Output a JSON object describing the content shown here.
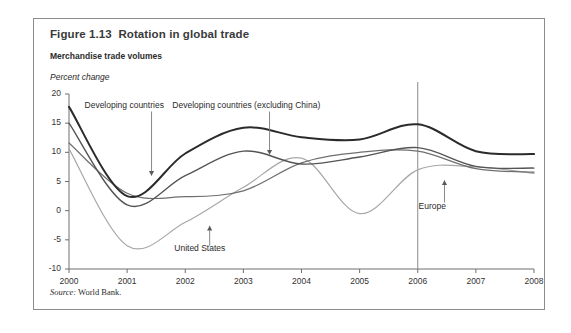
{
  "figure": {
    "title": "Figure 1.13  Rotation in global trade",
    "subtitle": "Merchandise trade volumes",
    "axis_unit": "Percent change",
    "source_prefix": "Source:",
    "source_text": " World Bank."
  },
  "chart_data": {
    "type": "line",
    "title": "Rotation in global trade",
    "subtitle": "Merchandise trade volumes",
    "xlabel": "",
    "ylabel": "Percent change",
    "x": [
      2000,
      2001,
      2002,
      2003,
      2004,
      2005,
      2006,
      2007,
      2008
    ],
    "xlim": [
      2000,
      2008
    ],
    "ylim": [
      -10,
      20
    ],
    "yticks": [
      -10,
      -5,
      0,
      5,
      10,
      15,
      20
    ],
    "ytick_labels": [
      "-10",
      "-5",
      "0",
      "5",
      "10",
      "15",
      "20"
    ],
    "xtick_labels": [
      "2000",
      "2001",
      "2002",
      "2003",
      "2004",
      "2005",
      "2006",
      "2007",
      "2008"
    ],
    "grid": false,
    "legend_position": "inline-annotations",
    "series": [
      {
        "name": "Developing countries",
        "color": "#2b2b2b",
        "width": 2.0,
        "values": [
          17.8,
          2.5,
          9.8,
          14.2,
          12.6,
          12.2,
          14.8,
          10.2,
          9.7
        ]
      },
      {
        "name": "Developing countries (excluding China)",
        "color": "#555555",
        "width": 1.4,
        "values": [
          15.0,
          1.0,
          6.0,
          10.2,
          8.0,
          9.2,
          10.8,
          7.6,
          7.3
        ]
      },
      {
        "name": "Europe",
        "color": "#6f6f6f",
        "width": 1.2,
        "values": [
          11.6,
          3.0,
          2.4,
          3.4,
          8.2,
          10.0,
          10.2,
          7.2,
          6.6
        ]
      },
      {
        "name": "United States",
        "color": "#a8a8a8",
        "width": 1.2,
        "values": [
          10.6,
          -6.0,
          -2.0,
          4.0,
          9.0,
          -0.5,
          7.0,
          7.5,
          6.4
        ]
      }
    ],
    "annotations": [
      {
        "label": "Developing countries",
        "series": "Developing countries",
        "label_x": 2000.95,
        "label_y": 18.0,
        "leader_from_y": 17.0,
        "leader_to_x": 2001.42,
        "leader_to_y": 6.0,
        "arrow": "down"
      },
      {
        "label": "Developing countries (excluding China)",
        "series": "Developing countries (excluding China)",
        "label_x": 2003.05,
        "label_y": 18.0,
        "leader_from_y": 17.0,
        "leader_to_x": 2003.45,
        "leader_to_y": 9.6,
        "arrow": "down"
      },
      {
        "label": "United States",
        "series": "United States",
        "label_x": 2002.25,
        "label_y": -6.6,
        "leader_from_y": -6.0,
        "leader_to_x": 2002.42,
        "leader_to_y": -2.6,
        "arrow": "up"
      },
      {
        "label": "Europe",
        "series": "Europe",
        "label_x": 2006.25,
        "label_y": 0.6,
        "leader_from_y": 1.4,
        "leader_to_x": 2006.46,
        "leader_to_y": 5.2,
        "arrow": "up"
      }
    ],
    "reference_lines": [
      {
        "type": "vertical",
        "x": 2006,
        "color": "#8a8a8a",
        "width": 1.0
      }
    ]
  }
}
